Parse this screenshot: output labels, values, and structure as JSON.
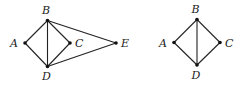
{
  "figure": {
    "graphs": [
      {
        "id": "left-graph",
        "nodes": [
          {
            "id": "A",
            "label": "A",
            "x": 25,
            "y": 43,
            "lx": 10,
            "ly": 47
          },
          {
            "id": "B",
            "label": "B",
            "x": 47.5,
            "y": 20.5,
            "lx": 42,
            "ly": 14
          },
          {
            "id": "C",
            "label": "C",
            "x": 70,
            "y": 43,
            "lx": 75,
            "ly": 47
          },
          {
            "id": "D",
            "label": "D",
            "x": 47.5,
            "y": 66.5,
            "lx": 42,
            "ly": 80
          },
          {
            "id": "E",
            "label": "E",
            "x": 116,
            "y": 43,
            "lx": 121,
            "ly": 47
          }
        ],
        "edges": [
          [
            "A",
            "B"
          ],
          [
            "A",
            "D"
          ],
          [
            "B",
            "C"
          ],
          [
            "C",
            "D"
          ],
          [
            "B",
            "D"
          ],
          [
            "B",
            "E"
          ],
          [
            "D",
            "E"
          ]
        ]
      },
      {
        "id": "right-graph",
        "nodes": [
          {
            "id": "A",
            "label": "A",
            "x": 174,
            "y": 42.5,
            "lx": 159,
            "ly": 46.5
          },
          {
            "id": "B",
            "label": "B",
            "x": 197,
            "y": 19.5,
            "lx": 191.5,
            "ly": 13
          },
          {
            "id": "C",
            "label": "C",
            "x": 220,
            "y": 42.5,
            "lx": 225,
            "ly": 46.5
          },
          {
            "id": "D",
            "label": "D",
            "x": 197,
            "y": 65,
            "lx": 191.5,
            "ly": 79
          }
        ],
        "edges": [
          [
            "A",
            "B"
          ],
          [
            "A",
            "D"
          ],
          [
            "B",
            "C"
          ],
          [
            "C",
            "D"
          ],
          [
            "B",
            "D"
          ]
        ]
      }
    ]
  }
}
